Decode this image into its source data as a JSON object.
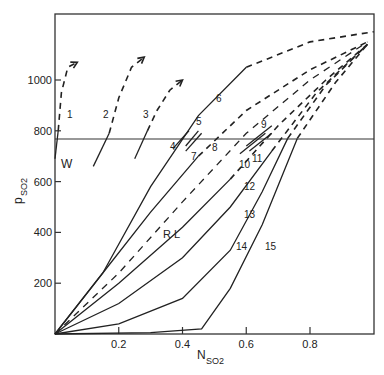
{
  "chart_data": {
    "type": "line",
    "title": "",
    "xlabel": "N",
    "xlabel_sub": "SO2",
    "ylabel": "p",
    "ylabel_sub": "SO2",
    "xlim": [
      0,
      1.0
    ],
    "ylim": [
      0,
      1260
    ],
    "grid": false,
    "legend": "none",
    "x_ticks": [
      {
        "value": 0.2,
        "label": "0.2"
      },
      {
        "value": 0.4,
        "label": "0.4"
      },
      {
        "value": 0.6,
        "label": "0.6"
      },
      {
        "value": 0.8,
        "label": "0.8"
      }
    ],
    "y_ticks": [
      {
        "value": 200,
        "label": "200"
      },
      {
        "value": 400,
        "label": "400"
      },
      {
        "value": 600,
        "label": "600"
      },
      {
        "value": 800,
        "label": "800"
      },
      {
        "value": 1000,
        "label": "1000"
      }
    ],
    "reference_line": {
      "orientation": "horizontal",
      "y": 770
    },
    "annotations": [
      {
        "text": "W",
        "x": 0.0,
        "y": 690
      },
      {
        "text": "R L",
        "x": 0.34,
        "y": 440
      }
    ],
    "series": [
      {
        "name": "1",
        "style": "solid+dashed-arrow",
        "points": [
          [
            0.0,
            690
          ],
          [
            0.01,
            800
          ],
          [
            0.02,
            950
          ],
          [
            0.04,
            1050
          ],
          [
            0.07,
            1070
          ]
        ]
      },
      {
        "name": "2",
        "style": "solid+dashed-arrow",
        "points": [
          [
            0.12,
            660
          ],
          [
            0.17,
            790
          ],
          [
            0.2,
            930
          ],
          [
            0.24,
            1050
          ],
          [
            0.28,
            1090
          ]
        ]
      },
      {
        "name": "3",
        "style": "solid+dashed-arrow",
        "points": [
          [
            0.25,
            690
          ],
          [
            0.29,
            800
          ],
          [
            0.32,
            880
          ],
          [
            0.36,
            960
          ],
          [
            0.4,
            1000
          ]
        ]
      },
      {
        "name": "4",
        "style": "solid-short",
        "points": [
          [
            0.37,
            730
          ],
          [
            0.42,
            800
          ]
        ]
      },
      {
        "name": "5",
        "style": "solid-short",
        "points": [
          [
            0.41,
            740
          ],
          [
            0.45,
            800
          ]
        ]
      },
      {
        "name": "6",
        "style": "solid+dashed",
        "points": [
          [
            0.0,
            0
          ],
          [
            0.15,
            240
          ],
          [
            0.3,
            580
          ],
          [
            0.45,
            860
          ],
          [
            0.6,
            1050
          ],
          [
            0.8,
            1150
          ],
          [
            1.0,
            1190
          ]
        ]
      },
      {
        "name": "7",
        "style": "solid-short",
        "points": [
          [
            0.41,
            720
          ],
          [
            0.46,
            790
          ]
        ]
      },
      {
        "name": "8",
        "style": "solid+dashed",
        "points": [
          [
            0.0,
            0
          ],
          [
            0.15,
            240
          ],
          [
            0.3,
            480
          ],
          [
            0.45,
            700
          ],
          [
            0.6,
            880
          ],
          [
            0.8,
            1040
          ],
          [
            0.98,
            1150
          ]
        ]
      },
      {
        "name": "9",
        "style": "solid-short",
        "points": [
          [
            0.6,
            740
          ],
          [
            0.68,
            820
          ]
        ]
      },
      {
        "name": "10",
        "style": "solid-short",
        "points": [
          [
            0.58,
            710
          ],
          [
            0.66,
            790
          ]
        ]
      },
      {
        "name": "11",
        "style": "solid-short",
        "points": [
          [
            0.61,
            720
          ],
          [
            0.68,
            790
          ]
        ]
      },
      {
        "name": "RL",
        "style": "dashed",
        "points": [
          [
            0.0,
            0
          ],
          [
            0.2,
            240
          ],
          [
            0.4,
            520
          ],
          [
            0.6,
            790
          ],
          [
            0.8,
            1000
          ],
          [
            0.98,
            1150
          ]
        ]
      },
      {
        "name": "12",
        "style": "solid+dashed",
        "points": [
          [
            0.0,
            0
          ],
          [
            0.2,
            200
          ],
          [
            0.4,
            420
          ],
          [
            0.55,
            610
          ],
          [
            0.7,
            820
          ],
          [
            0.85,
            1000
          ],
          [
            0.98,
            1140
          ]
        ]
      },
      {
        "name": "13",
        "style": "solid+dashed",
        "points": [
          [
            0.0,
            0
          ],
          [
            0.2,
            120
          ],
          [
            0.4,
            300
          ],
          [
            0.55,
            500
          ],
          [
            0.68,
            720
          ],
          [
            0.82,
            950
          ],
          [
            0.98,
            1140
          ]
        ]
      },
      {
        "name": "14",
        "style": "solid+dashed",
        "points": [
          [
            0.0,
            0
          ],
          [
            0.2,
            40
          ],
          [
            0.4,
            140
          ],
          [
            0.55,
            330
          ],
          [
            0.65,
            560
          ],
          [
            0.73,
            770
          ],
          [
            0.85,
            980
          ],
          [
            0.98,
            1140
          ]
        ]
      },
      {
        "name": "15",
        "style": "solid+dashed",
        "points": [
          [
            0.0,
            0
          ],
          [
            0.3,
            5
          ],
          [
            0.46,
            20
          ],
          [
            0.55,
            180
          ],
          [
            0.65,
            430
          ],
          [
            0.76,
            770
          ],
          [
            0.88,
            990
          ],
          [
            0.98,
            1140
          ]
        ]
      }
    ]
  }
}
